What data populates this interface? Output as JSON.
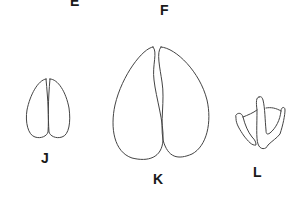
{
  "figure": {
    "labels": {
      "e": "E",
      "f": "F",
      "j": "J",
      "k": "K",
      "l": "L"
    },
    "drawings": [
      {
        "id": "J",
        "description": "small paired cloven hoofprint outline"
      },
      {
        "id": "K",
        "description": "large paired cloven hoofprint outline"
      },
      {
        "id": "L",
        "description": "three-toed bird-like footprint outline"
      }
    ],
    "colors": {
      "background": "#ffffff",
      "stroke": "#444444",
      "label": "#1a1a1a"
    }
  }
}
